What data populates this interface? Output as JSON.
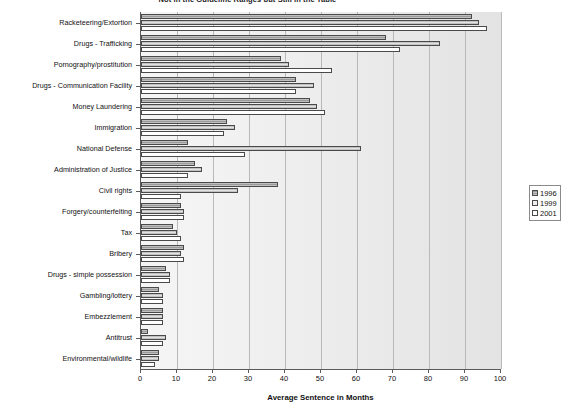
{
  "chart_data": {
    "type": "bar",
    "orientation": "horizontal",
    "title": "Not in the Guideline Ranges but Still in the Table",
    "xlabel": "Average Sentence in Months",
    "ylabel": "",
    "xlim": [
      0,
      100
    ],
    "xticks": [
      0,
      10,
      20,
      30,
      40,
      50,
      60,
      70,
      80,
      90,
      100
    ],
    "grid": true,
    "legend_position": "right",
    "categories": [
      "Racketeering/Extortion",
      "Drugs - Trafficking",
      "Pornography/prostitution",
      "Drugs - Communication Facility",
      "Money Laundering",
      "Immigration",
      "National Defense",
      "Administration of Justice",
      "Civil rights",
      "Forgery/counterfeiting",
      "Tax",
      "Bribery",
      "Drugs - simple possession",
      "Gambling/lottery",
      "Embezzlement",
      "Antitrust",
      "Environmental/wildlife"
    ],
    "series": [
      {
        "name": "1996",
        "color": "#9a9a9a",
        "values": [
          92,
          68,
          39,
          43,
          47,
          24,
          13,
          15,
          38,
          11,
          9,
          12,
          7,
          5,
          6,
          2,
          5
        ]
      },
      {
        "name": "1999",
        "color": "#e2e2e2",
        "values": [
          94,
          83,
          41,
          48,
          49,
          26,
          61,
          17,
          27,
          12,
          10,
          11,
          8,
          6,
          6,
          7,
          5
        ]
      },
      {
        "name": "2001",
        "color": "#ffffff",
        "values": [
          96,
          72,
          53,
          43,
          51,
          23,
          29,
          13,
          11,
          12,
          11,
          12,
          8,
          6,
          6,
          6,
          4
        ]
      }
    ]
  },
  "legend": {
    "entries": [
      {
        "label": "1996",
        "key": "y1996"
      },
      {
        "label": "1999",
        "key": "y1999"
      },
      {
        "label": "2001",
        "key": "y2001"
      }
    ]
  }
}
